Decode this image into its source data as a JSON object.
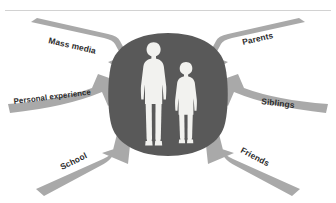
{
  "figure": {
    "type": "converging-arrows-diagram",
    "background_color": "#ffffff",
    "rule_color": "#d2d2d2"
  },
  "center": {
    "blob_name": "central-blob",
    "blob_color": "#595959",
    "figures": [
      {
        "name": "adult-figure",
        "role": "adult",
        "color": "#f2f2ef"
      },
      {
        "name": "child-figure",
        "role": "child",
        "color": "#f2f2ef"
      }
    ]
  },
  "arrows": [
    {
      "id": "mass-media",
      "label": "Mass media",
      "position": "top-left",
      "direction": "down-right",
      "color": "#a9a9a9",
      "label_rotation": 14
    },
    {
      "id": "parents",
      "label": "Parents",
      "position": "top-right",
      "direction": "down-left",
      "color": "#a9a9a9",
      "label_rotation": -14
    },
    {
      "id": "personal-experience",
      "label": "Personal experience",
      "position": "middle-left",
      "direction": "right",
      "color": "#a9a9a9",
      "label_rotation": -6
    },
    {
      "id": "siblings",
      "label": "Siblings",
      "position": "middle-right",
      "direction": "left",
      "color": "#a9a9a9",
      "label_rotation": 6
    },
    {
      "id": "school",
      "label": "School",
      "position": "bottom-left",
      "direction": "up-right",
      "color": "#a9a9a9",
      "label_rotation": -26
    },
    {
      "id": "friends",
      "label": "Friends",
      "position": "bottom-right",
      "direction": "up-left",
      "color": "#a9a9a9",
      "label_rotation": 28
    }
  ]
}
